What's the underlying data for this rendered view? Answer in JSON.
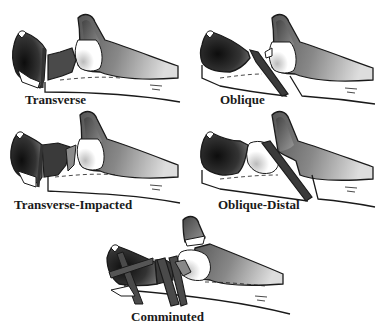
{
  "figure": {
    "panels": [
      {
        "id": "transverse",
        "label": "Transverse"
      },
      {
        "id": "oblique",
        "label": "Oblique"
      },
      {
        "id": "transverse-impacted",
        "label": "Transverse-Impacted"
      },
      {
        "id": "oblique-distal",
        "label": "Oblique-Distal"
      },
      {
        "id": "comminuted",
        "label": "Comminuted"
      }
    ]
  },
  "colors": {
    "outline": "#1a1a1a",
    "dark_fragment": "#2a2a2a",
    "mid_shade": "#6a6a6a",
    "shaft_shade": "#8a8a8a",
    "background": "#ffffff"
  }
}
